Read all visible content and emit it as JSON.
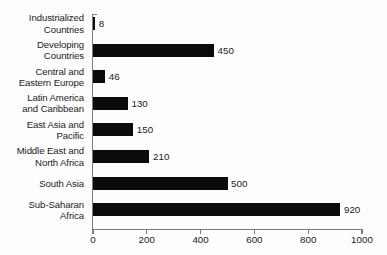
{
  "chart_data": {
    "type": "bar",
    "orientation": "horizontal",
    "title": "",
    "xlabel": "",
    "ylabel": "",
    "xlim": [
      0,
      1000
    ],
    "grid": false,
    "legend": false,
    "xticks": [
      "0",
      "200",
      "400",
      "600",
      "800",
      "1000"
    ],
    "xtick_values": [
      0,
      200,
      400,
      600,
      800,
      1000
    ],
    "categories": [
      "Industrialized\nCountries",
      "Developing\nCountries",
      "Central and\nEastern Europe",
      "Latin America\nand Caribbean",
      "East Asia and\nPacific",
      "Middle East and\nNorth Africa",
      "South Asia",
      "Sub-Saharan\nAfrica"
    ],
    "values": [
      8,
      450,
      46,
      130,
      150,
      210,
      500,
      920
    ],
    "value_labels": [
      "8",
      "450",
      "46",
      "130",
      "150",
      "210",
      "500",
      "920"
    ],
    "bar_color": "#0b0b0b",
    "axis_color": "#7c7c7c",
    "background_color": "#fdfdfd"
  }
}
